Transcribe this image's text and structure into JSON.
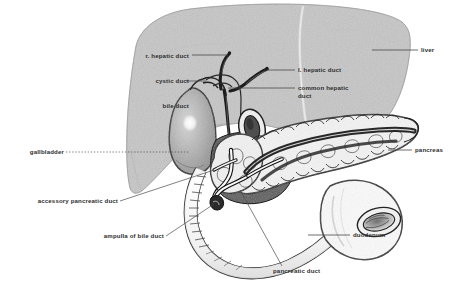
{
  "figure": {
    "background_color": "#ffffff",
    "label_color": "#2e2e2e",
    "leader_line_color": "#555555"
  },
  "organs": [
    {
      "name": "liver",
      "fill": "#c6c6c6",
      "outline": "#9a9a9a"
    },
    {
      "name": "gallbladder",
      "fill": "#b4b4b4",
      "outline": "#2b2b2b"
    },
    {
      "name": "pancreas",
      "fill": "#f2f2f2",
      "outline": "#1f1f1f"
    },
    {
      "name": "duodenum",
      "fill": "#fbfbfb",
      "outline": "#2b2b2b"
    }
  ],
  "labels": [
    {
      "id": "r-hepatic-duct",
      "text": "r. hepatic duct",
      "align": "right",
      "x": 131,
      "y": 56,
      "w": 58
    },
    {
      "id": "cystic-duct",
      "text": "cystic duct",
      "align": "right",
      "x": 131,
      "y": 81,
      "w": 58
    },
    {
      "id": "bile-duct",
      "text": "bile duct",
      "align": "right",
      "x": 131,
      "y": 106,
      "w": 58
    },
    {
      "id": "l-hepatic-duct",
      "text": "l. hepatic duct",
      "align": "left",
      "x": 297,
      "y": 70,
      "w": 60
    },
    {
      "id": "common-hepatic-duct",
      "text": "common hepatic duct",
      "align": "left",
      "x": 297,
      "y": 87,
      "w": 52
    },
    {
      "id": "liver",
      "text": "liver",
      "align": "left",
      "x": 420,
      "y": 50,
      "w": 30
    },
    {
      "id": "pancreas",
      "text": "pancreas",
      "align": "left",
      "x": 414,
      "y": 150,
      "w": 42
    },
    {
      "id": "duodenum",
      "text": "duodenum",
      "align": "left",
      "x": 352,
      "y": 235,
      "w": 44
    },
    {
      "id": "gallbladder",
      "text": "gallbladder",
      "align": "right",
      "x": 16,
      "y": 150,
      "w": 48
    },
    {
      "id": "accessory-pancreatic-duct",
      "text": "accessory pancreatic duct",
      "align": "right",
      "x": 14,
      "y": 201,
      "w": 104
    },
    {
      "id": "ampulla-of-bile-duct",
      "text": "ampulla of bile duct",
      "align": "right",
      "x": 80,
      "y": 236,
      "w": 84
    },
    {
      "id": "pancreatic-duct",
      "text": "pancreatic duct",
      "align": "left",
      "x": 272,
      "y": 271,
      "w": 66
    }
  ],
  "structures": {
    "ducts": [
      "right hepatic duct",
      "left hepatic duct",
      "common hepatic duct",
      "cystic duct",
      "bile duct",
      "pancreatic duct",
      "accessory pancreatic duct",
      "ampulla of bile duct"
    ]
  }
}
